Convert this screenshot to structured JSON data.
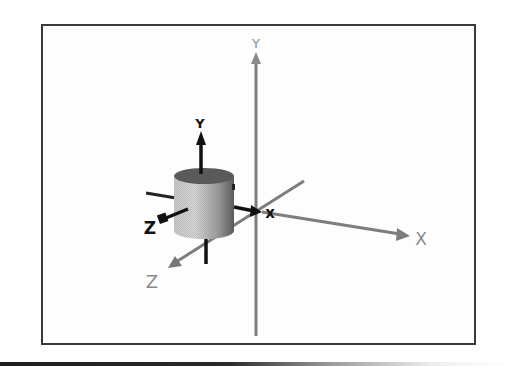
{
  "figure": {
    "type": "3d-coordinate-diagram"
  },
  "world_axes": {
    "x_label": "X",
    "y_label": "Y",
    "z_label": "Z",
    "color": "#8a8a8a"
  },
  "local_axes": {
    "x_label": "x",
    "y_label": "Y",
    "z_label": "Z",
    "color": "#111111"
  },
  "object": {
    "shape": "cylinder",
    "fill_light": "#d9d9d9",
    "fill_dark": "#6e6e6e",
    "top_color": "#555555"
  },
  "colors": {
    "frame": "#3a3a3a",
    "background": "#ffffff"
  }
}
